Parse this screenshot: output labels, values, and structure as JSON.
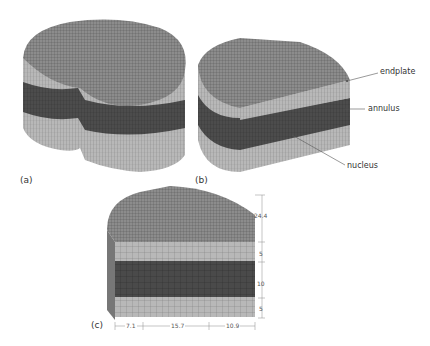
{
  "figure": {
    "panels": [
      {
        "id": "a",
        "label": "(a)",
        "description": "Full disc FE mesh"
      },
      {
        "id": "b",
        "label": "(b)",
        "description": "Half disc FE mesh with annotations"
      },
      {
        "id": "c",
        "label": "(c)",
        "description": "Half disc front view with dimensions"
      }
    ],
    "annotations": {
      "endplate": "endplate",
      "annulus": "annulus",
      "nucleus": "nucleus"
    },
    "dimensions": {
      "vertical": [
        "24.4",
        "5",
        "10",
        "5"
      ],
      "horizontal": [
        "7.1",
        "15.7",
        "10.9"
      ]
    },
    "colors": {
      "endplate": "#b5b5b5",
      "annulus_dark": "#4a4a4a",
      "top_surface": "#8a8a8a",
      "mesh_line": "#3a3a3a"
    }
  }
}
